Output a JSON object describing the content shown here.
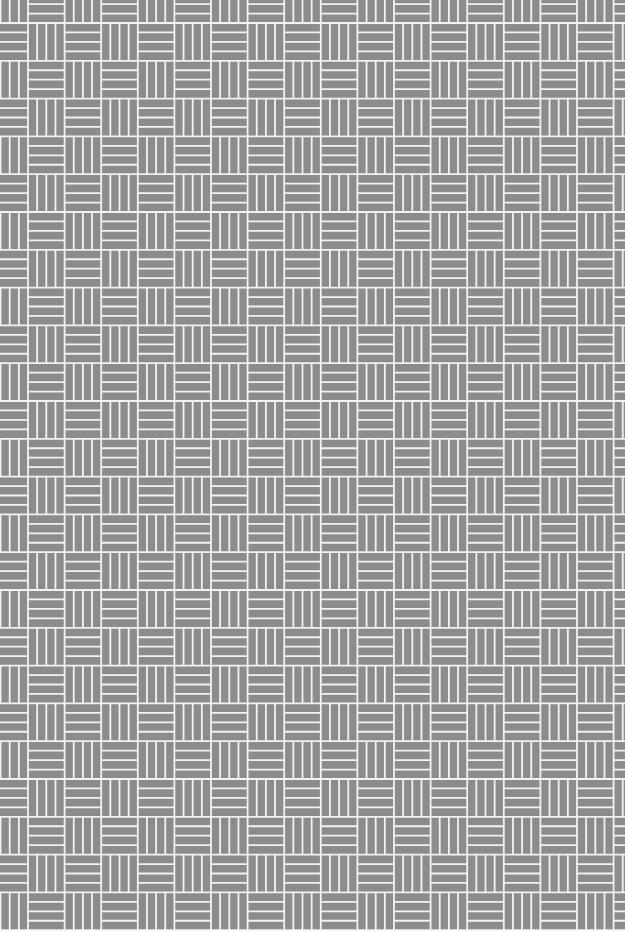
{
  "image": {
    "description": "Basketweave tile pattern texture",
    "pattern": "basketweave",
    "planks_per_cell": 4,
    "colors": {
      "background": "#8c8c8c",
      "line": "#f2f2f2"
    }
  }
}
